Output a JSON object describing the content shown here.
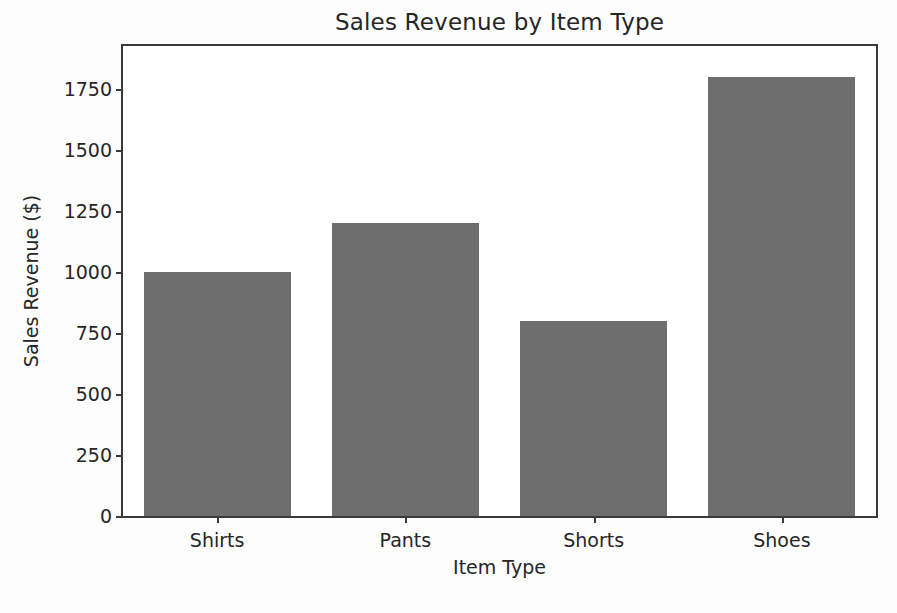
{
  "chart_data": {
    "type": "bar",
    "title": "Sales Revenue by Item Type",
    "xlabel": "Item Type",
    "ylabel": "Sales Revenue ($)",
    "categories": [
      "Shirts",
      "Pants",
      "Shorts",
      "Shoes"
    ],
    "values": [
      1000,
      1200,
      800,
      1800
    ],
    "ylim": [
      0,
      1925
    ],
    "yticks": [
      0,
      250,
      500,
      750,
      1000,
      1250,
      1500,
      1750
    ],
    "ytick_labels": [
      "0",
      "250",
      "500",
      "750",
      "1000",
      "1250",
      "1500",
      "1750"
    ],
    "xtick_labels": [
      "Shirts",
      "Pants",
      "Shorts",
      "Shoes"
    ],
    "grid": false,
    "legend": null,
    "bar_color": "#6e6e6e",
    "axis_color": "#3a3a3a",
    "background_color": "#ffffff",
    "bar_width_fraction": 0.78
  }
}
